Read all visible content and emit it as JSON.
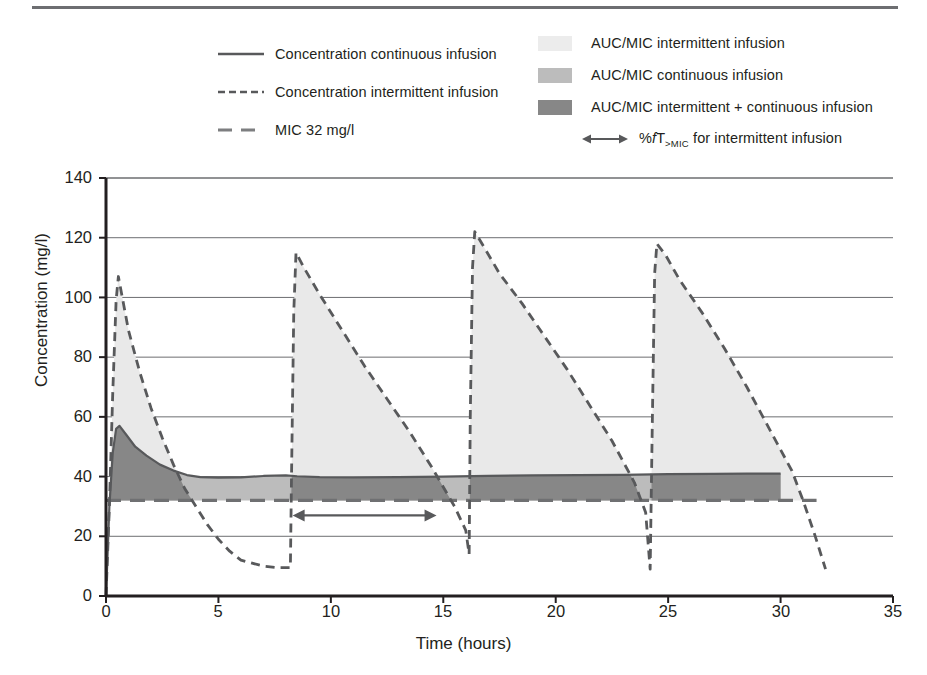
{
  "figure": {
    "type": "pharmacokinetic-concentration-time-plot"
  },
  "legend": {
    "left_items": [
      {
        "key": "solid-line",
        "label": "Concentration continuous infusion"
      },
      {
        "key": "short-dashed-line",
        "label": "Concentration intermittent infusion"
      },
      {
        "key": "long-dashed-line",
        "label": "MIC 32 mg/l"
      }
    ],
    "right_items": [
      {
        "key": "swatch-light",
        "label": "AUC/MIC intermittent infusion",
        "color": "#e9e9e9"
      },
      {
        "key": "swatch-medium",
        "label": "AUC/MIC continuous infusion",
        "color": "#bcbcbc"
      },
      {
        "key": "swatch-dark",
        "label": "AUC/MIC intermittent + continuous infusion",
        "color": "#878787"
      }
    ],
    "arrow_item": {
      "key": "double-arrow",
      "label_prefix": "%",
      "label_italic": "f",
      "label_t": "T",
      "label_sub": ">MIC",
      "label_suffix": " for intermittent infusion"
    }
  },
  "chart_data": {
    "type": "line",
    "title": "",
    "xlabel": "Time (hours)",
    "ylabel": "Concentration (mg/l)",
    "xlim": [
      0,
      35
    ],
    "ylim": [
      0,
      140
    ],
    "xticks": [
      0,
      5,
      10,
      15,
      20,
      25,
      30,
      35
    ],
    "yticks": [
      0,
      20,
      40,
      60,
      80,
      100,
      120,
      140
    ],
    "grid": "horizontal",
    "legend_position": "above-plot",
    "mic_value": 32,
    "mic_label": "MIC 32 mg/l",
    "annotations": [
      {
        "name": "fT-above-MIC-arrow",
        "type": "double-headed-arrow",
        "x_start": 8.3,
        "x_end": 14.7,
        "y": 27
      }
    ],
    "series": [
      {
        "name": "Concentration intermittent infusion",
        "style": "dashed",
        "color": "#58595b",
        "points": [
          [
            0.0,
            0
          ],
          [
            0.15,
            30
          ],
          [
            0.3,
            68
          ],
          [
            0.45,
            99
          ],
          [
            0.55,
            107
          ],
          [
            0.7,
            101
          ],
          [
            1.0,
            89
          ],
          [
            1.5,
            75
          ],
          [
            2.0,
            63
          ],
          [
            2.5,
            53
          ],
          [
            3.0,
            44
          ],
          [
            3.5,
            36
          ],
          [
            4.0,
            30
          ],
          [
            4.5,
            24
          ],
          [
            5.0,
            19
          ],
          [
            5.5,
            15
          ],
          [
            6.0,
            12
          ],
          [
            6.5,
            11
          ],
          [
            7.0,
            10
          ],
          [
            7.6,
            9.5
          ],
          [
            8.2,
            9.5
          ],
          [
            8.25,
            40
          ],
          [
            8.35,
            95
          ],
          [
            8.45,
            115
          ],
          [
            8.8,
            110
          ],
          [
            9.5,
            101
          ],
          [
            10.5,
            89
          ],
          [
            11.5,
            77
          ],
          [
            12.5,
            66
          ],
          [
            13.5,
            55
          ],
          [
            14.5,
            43
          ],
          [
            15.5,
            30
          ],
          [
            16.0,
            22
          ],
          [
            16.15,
            14
          ],
          [
            16.2,
            60
          ],
          [
            16.3,
            110
          ],
          [
            16.4,
            122
          ],
          [
            16.8,
            117
          ],
          [
            17.5,
            108
          ],
          [
            18.5,
            98
          ],
          [
            19.5,
            87
          ],
          [
            20.5,
            76
          ],
          [
            21.5,
            64
          ],
          [
            22.5,
            52
          ],
          [
            23.5,
            38
          ],
          [
            24.0,
            28
          ],
          [
            24.2,
            9
          ],
          [
            24.3,
            60
          ],
          [
            24.4,
            108
          ],
          [
            24.5,
            118
          ],
          [
            24.9,
            114
          ],
          [
            25.5,
            106
          ],
          [
            26.5,
            95
          ],
          [
            27.5,
            83
          ],
          [
            28.5,
            70
          ],
          [
            29.5,
            56
          ],
          [
            30.5,
            42
          ],
          [
            31.0,
            32
          ],
          [
            31.5,
            21
          ],
          [
            32.0,
            9
          ]
        ]
      },
      {
        "name": "Concentration continuous infusion",
        "style": "solid",
        "color": "#58595b",
        "points": [
          [
            0.0,
            0
          ],
          [
            0.15,
            30
          ],
          [
            0.3,
            48
          ],
          [
            0.45,
            56
          ],
          [
            0.6,
            57
          ],
          [
            0.9,
            54
          ],
          [
            1.3,
            50
          ],
          [
            1.8,
            47
          ],
          [
            2.4,
            44
          ],
          [
            3.0,
            42
          ],
          [
            3.6,
            40.5
          ],
          [
            4.2,
            39.8
          ],
          [
            5.0,
            39.6
          ],
          [
            6.0,
            39.7
          ],
          [
            7.0,
            40.2
          ],
          [
            8.0,
            40.4
          ],
          [
            8.5,
            40.1
          ],
          [
            9.5,
            39.8
          ],
          [
            11.0,
            39.7
          ],
          [
            13.0,
            39.8
          ],
          [
            15.0,
            40.0
          ],
          [
            17.0,
            40.2
          ],
          [
            19.0,
            40.4
          ],
          [
            21.0,
            40.5
          ],
          [
            23.0,
            40.6
          ],
          [
            25.0,
            40.8
          ],
          [
            27.0,
            40.9
          ],
          [
            28.5,
            41.0
          ],
          [
            30.0,
            41.0
          ]
        ]
      }
    ],
    "shaded_regions": [
      {
        "name": "AUC/MIC intermittent infusion",
        "color": "#e9e9e9",
        "description": "Area under intermittent-infusion curve above MIC"
      },
      {
        "name": "AUC/MIC continuous infusion",
        "color": "#bcbcbc",
        "description": "Area under continuous-infusion curve above MIC"
      },
      {
        "name": "AUC/MIC intermittent + continuous infusion",
        "color": "#878787",
        "description": "Overlap of both areas above MIC"
      }
    ]
  },
  "axis_text": {
    "xticks": [
      "0",
      "5",
      "10",
      "15",
      "20",
      "25",
      "30",
      "35"
    ],
    "yticks": [
      "0",
      "20",
      "40",
      "60",
      "80",
      "100",
      "120",
      "140"
    ]
  },
  "colors": {
    "light": "#e9e9e9",
    "medium": "#bcbcbc",
    "dark": "#878787",
    "line": "#58595b",
    "grid": "#6d6e71",
    "text": "#231f20"
  }
}
